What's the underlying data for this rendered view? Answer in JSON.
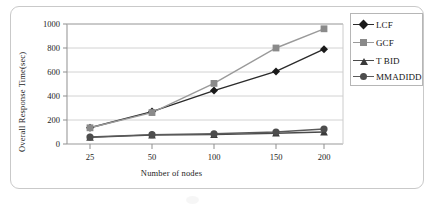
{
  "figure": {
    "frame_color": "#c9c9c9",
    "background": "#ffffff"
  },
  "chart_data": {
    "type": "line",
    "title": "",
    "subtitle": "",
    "xlabel": "Number of nodes",
    "ylabel": "Overall Response Time(sec)",
    "categories": [
      "25",
      "50",
      "100",
      "150",
      "200"
    ],
    "x": [
      25,
      50,
      100,
      150,
      200
    ],
    "xtick_labels": [
      "25",
      "50",
      "100",
      "150",
      "200"
    ],
    "ytick_labels": [
      "0",
      "200",
      "400",
      "600",
      "800",
      "1000"
    ],
    "yticks": [
      0,
      200,
      400,
      600,
      800,
      1000
    ],
    "ylim": [
      0,
      1000
    ],
    "grid": "horizontal",
    "legend_position": "right-outside",
    "series": [
      {
        "name": "LCF",
        "marker": "diamond",
        "color": "#1a1a1a",
        "line_color": "#2b2b2b",
        "values": [
          135,
          270,
          445,
          605,
          790
        ]
      },
      {
        "name": "GCF",
        "marker": "square",
        "color": "#8a8a8a",
        "line_color": "#9a9a9a",
        "values": [
          135,
          262,
          505,
          800,
          960
        ]
      },
      {
        "name": "T BID",
        "marker": "triangle",
        "color": "#3a3a3a",
        "line_color": "#4a4a4a",
        "values": [
          55,
          75,
          78,
          90,
          100
        ]
      },
      {
        "name": "MMADIDD",
        "marker": "circle",
        "color": "#4d4d4d",
        "line_color": "#5a5a5a",
        "values": [
          58,
          78,
          85,
          100,
          125
        ]
      }
    ],
    "legend": [
      {
        "label": "LCF",
        "marker": "diamond",
        "color": "#1a1a1a"
      },
      {
        "label": "GCF",
        "marker": "square",
        "color": "#8a8a8a"
      },
      {
        "label": "T BID",
        "marker": "triangle",
        "color": "#3a3a3a"
      },
      {
        "label": "MMADIDD",
        "marker": "circle",
        "color": "#4d4d4d"
      }
    ]
  }
}
